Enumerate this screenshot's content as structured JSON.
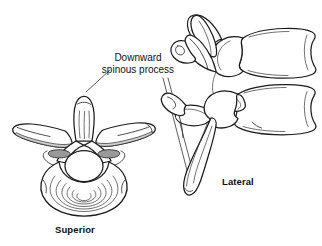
{
  "figure": {
    "kind": "anatomical-line-drawing",
    "background_color": "#ffffff",
    "line_color": "#1c1c1c",
    "shade_color": "#9a9a9a"
  },
  "callouts": [
    {
      "id": "downward-spinous-process",
      "line1": "Downward",
      "line2": "spinous process"
    }
  ],
  "views": {
    "superior": {
      "caption": "Superior",
      "parts": [
        "spinous process",
        "transverse process",
        "superior articular facet",
        "vertebral foramen",
        "vertebral body"
      ]
    },
    "lateral": {
      "caption": "Lateral",
      "parts": [
        "vertebral body",
        "intervertebral foramen",
        "superior articular process",
        "downward spinous process",
        "transverse process"
      ]
    }
  }
}
